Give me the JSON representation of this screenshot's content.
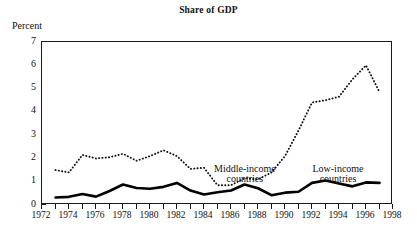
{
  "figure": {
    "title": "Share of GDP",
    "ylabel": "Percent"
  },
  "annotations": [
    {
      "name": "middle-income",
      "line1": "Middle-income",
      "line2": "countries"
    },
    {
      "name": "low-income",
      "line1": "Low-income",
      "line2": "countries"
    }
  ],
  "chart_data": {
    "type": "line",
    "title": "Share of GDP",
    "xlabel": "",
    "ylabel": "Percent",
    "xlim": [
      1972,
      1998
    ],
    "ylim": [
      0,
      7
    ],
    "yticks": [
      0,
      1,
      2,
      3,
      4,
      5,
      6,
      7
    ],
    "xticks": [
      1972,
      1973,
      1974,
      1975,
      1976,
      1977,
      1978,
      1979,
      1980,
      1981,
      1982,
      1983,
      1984,
      1985,
      1986,
      1987,
      1988,
      1989,
      1990,
      1991,
      1992,
      1993,
      1994,
      1995,
      1996,
      1997,
      1998
    ],
    "xtick_labels": [
      "1972",
      "1974",
      "1976",
      "1978",
      "1980",
      "1982",
      "1984",
      "1986",
      "1988",
      "1990",
      "1992",
      "1994",
      "1996",
      "1998"
    ],
    "xtick_labels_years": [
      1972,
      1974,
      1976,
      1978,
      1980,
      1982,
      1984,
      1986,
      1988,
      1990,
      1992,
      1994,
      1996,
      1998
    ],
    "grid": false,
    "legend_position": "inline-annotation",
    "x": [
      1973,
      1974,
      1975,
      1976,
      1977,
      1978,
      1979,
      1980,
      1981,
      1982,
      1983,
      1984,
      1985,
      1986,
      1987,
      1988,
      1989,
      1990,
      1991,
      1992,
      1993,
      1994,
      1995,
      1996,
      1997
    ],
    "series": [
      {
        "name": "Middle-income countries",
        "style": "dotted",
        "color": "#111111",
        "values": [
          1.5,
          1.4,
          2.15,
          2.0,
          2.05,
          2.2,
          1.9,
          2.1,
          2.35,
          2.1,
          1.55,
          1.6,
          0.85,
          0.85,
          1.15,
          1.1,
          1.4,
          2.1,
          3.2,
          4.4,
          4.5,
          4.65,
          5.4,
          6.0,
          4.85
        ]
      },
      {
        "name": "Low-income countries",
        "style": "solid",
        "color": "#000000",
        "values": [
          0.32,
          0.35,
          0.47,
          0.36,
          0.6,
          0.88,
          0.73,
          0.7,
          0.78,
          0.95,
          0.62,
          0.45,
          0.55,
          0.62,
          0.88,
          0.72,
          0.42,
          0.53,
          0.57,
          0.95,
          1.05,
          0.92,
          0.8,
          0.97,
          0.95
        ]
      }
    ]
  }
}
